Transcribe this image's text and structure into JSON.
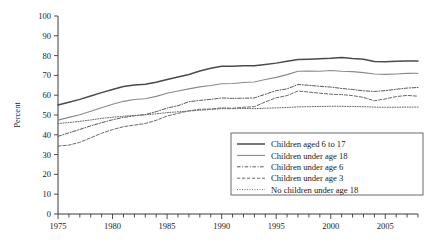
{
  "chart_data": {
    "type": "line",
    "title": "",
    "xlabel": "",
    "ylabel": "Percent",
    "xlim": [
      1975,
      2008
    ],
    "ylim": [
      0,
      100
    ],
    "grid": false,
    "legend_position": "bottom-right",
    "x": [
      1975,
      1976,
      1977,
      1978,
      1979,
      1980,
      1981,
      1982,
      1983,
      1984,
      1985,
      1986,
      1987,
      1988,
      1989,
      1990,
      1991,
      1992,
      1993,
      1994,
      1995,
      1996,
      1997,
      1998,
      1999,
      2000,
      2001,
      2002,
      2003,
      2004,
      2005,
      2006,
      2007,
      2008
    ],
    "y_ticks": [
      0,
      10,
      20,
      30,
      40,
      50,
      60,
      70,
      80,
      90,
      100
    ],
    "x_ticks_labeled": [
      1975,
      1980,
      1985,
      1990,
      1995,
      2000,
      2005
    ],
    "series": [
      {
        "name": "Children aged 6 to 17",
        "style": "solid",
        "color": "#4a4a4a",
        "width": 1.5,
        "values": [
          55.0,
          56.4,
          57.9,
          59.6,
          61.3,
          62.9,
          64.4,
          65.2,
          65.5,
          66.5,
          67.9,
          69.2,
          70.5,
          72.2,
          73.6,
          74.6,
          74.6,
          74.9,
          74.9,
          75.5,
          76.2,
          77.1,
          78.0,
          78.2,
          78.4,
          78.6,
          79.0,
          78.5,
          78.2,
          77.0,
          76.9,
          77.2,
          77.3,
          77.3
        ]
      },
      {
        "name": "Children under age 18",
        "style": "solid",
        "color": "#8a8a8a",
        "width": 1.1,
        "values": [
          47.4,
          48.8,
          50.1,
          51.9,
          53.7,
          55.4,
          56.9,
          57.8,
          58.2,
          59.4,
          61.0,
          62.1,
          63.2,
          64.2,
          64.9,
          65.8,
          65.9,
          66.4,
          66.7,
          67.9,
          69.0,
          70.4,
          72.1,
          72.2,
          72.1,
          72.5,
          72.1,
          71.9,
          71.4,
          70.7,
          70.5,
          70.7,
          71.0,
          71.1
        ]
      },
      {
        "name": "Children under age 6",
        "style": "dashdot",
        "color": "#5a5a5a",
        "width": 1.0,
        "values": [
          39.2,
          41.0,
          42.7,
          44.5,
          46.1,
          47.6,
          48.8,
          49.6,
          50.2,
          51.7,
          53.5,
          54.7,
          56.7,
          57.4,
          57.9,
          58.6,
          58.4,
          58.5,
          58.6,
          60.5,
          62.3,
          63.2,
          65.4,
          65.0,
          64.5,
          64.1,
          63.4,
          62.9,
          62.2,
          61.9,
          62.3,
          63.0,
          63.6,
          63.9
        ]
      },
      {
        "name": "Children under age 3",
        "style": "dashed",
        "color": "#6a6a6a",
        "width": 1.0,
        "values": [
          34.3,
          34.8,
          36.2,
          38.5,
          40.8,
          42.6,
          44.1,
          44.9,
          45.7,
          47.3,
          49.5,
          50.8,
          52.1,
          52.9,
          53.0,
          53.6,
          53.4,
          53.9,
          54.2,
          56.6,
          58.7,
          59.8,
          62.1,
          61.6,
          61.0,
          60.5,
          60.3,
          59.8,
          58.9,
          57.2,
          58.1,
          59.3,
          59.9,
          59.5
        ]
      },
      {
        "name": "No children under age 18",
        "style": "dotted",
        "color": "#6a6a6a",
        "width": 1.0,
        "values": [
          45.7,
          46.2,
          46.8,
          47.5,
          48.3,
          48.9,
          49.4,
          49.8,
          50.1,
          50.6,
          51.2,
          51.6,
          52.0,
          52.4,
          52.8,
          53.2,
          53.2,
          53.3,
          53.2,
          53.4,
          53.6,
          53.8,
          54.1,
          54.2,
          54.3,
          54.4,
          54.4,
          54.3,
          54.2,
          54.0,
          53.9,
          53.9,
          54.0,
          54.0
        ]
      }
    ]
  },
  "axes": {
    "y_label": "Percent"
  },
  "legend": {
    "entries": [
      {
        "label": "Children aged 6 to 17"
      },
      {
        "label": "Children under age 18"
      },
      {
        "label": "Children under age 6"
      },
      {
        "label": "Children under age 3"
      },
      {
        "label": "No children under age 18"
      }
    ]
  }
}
